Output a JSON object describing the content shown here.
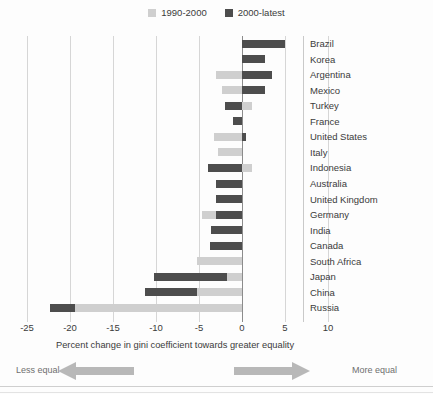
{
  "legend": {
    "entries": [
      {
        "label": "1990-2000",
        "color": "#cfcfcf",
        "icon": "legend-swatch-light"
      },
      {
        "label": "2000-latest",
        "color": "#4d4d4d",
        "icon": "legend-swatch-dark"
      }
    ]
  },
  "axis": {
    "title": "Percent change in gini coefficient towards greater equality",
    "ticks": [
      "-25",
      "-20",
      "-15",
      "-10",
      "-5",
      "0",
      "5",
      "10"
    ]
  },
  "annotation": {
    "left_label": "Less equal",
    "right_label": "More equal",
    "left_arrow_icon": "arrow-left-icon",
    "right_arrow_icon": "arrow-right-icon"
  },
  "chart_data": {
    "type": "bar",
    "orientation": "horizontal",
    "title": "",
    "xlabel": "Percent change in gini coefficient towards greater equality",
    "ylabel": "",
    "xlim": [
      -27,
      12
    ],
    "xticks": [
      -25,
      -20,
      -15,
      -10,
      -5,
      0,
      5,
      10
    ],
    "grid": true,
    "legend_position": "top-center",
    "categories": [
      "Brazil",
      "Korea",
      "Argentina",
      "Mexico",
      "Turkey",
      "France",
      "United States",
      "Italy",
      "Indonesia",
      "Australia",
      "United Kingdom",
      "Germany",
      "India",
      "Canada",
      "South Africa",
      "Japan",
      "China",
      "Russia"
    ],
    "series": [
      {
        "name": "1990-2000",
        "color": "#cfcfcf",
        "values": [
          0.0,
          0.0,
          -3.0,
          -2.3,
          1.2,
          0.0,
          -3.2,
          -2.8,
          1.2,
          0.0,
          0.0,
          -4.7,
          -3.6,
          -3.7,
          -5.2,
          -1.8,
          -5.2,
          -19.4
        ]
      },
      {
        "name": "2000-latest",
        "color": "#4d4d4d",
        "values": [
          5.0,
          2.7,
          3.5,
          2.7,
          -2.0,
          -1.0,
          0.5,
          0.0,
          -4.0,
          -3.0,
          -3.0,
          -3.0,
          -3.6,
          -3.7,
          0.0,
          -10.2,
          -11.3,
          -22.3
        ]
      }
    ],
    "bar_segments": [
      {
        "category": "Brazil",
        "light_from": 0.0,
        "light_to": 0.0,
        "dark_from": 0.0,
        "dark_to": 5.0
      },
      {
        "category": "Korea",
        "light_from": 0.0,
        "light_to": 0.0,
        "dark_from": 0.0,
        "dark_to": 2.7
      },
      {
        "category": "Argentina",
        "light_from": -3.0,
        "light_to": 0.0,
        "dark_from": 0.0,
        "dark_to": 3.5
      },
      {
        "category": "Mexico",
        "light_from": -2.3,
        "light_to": 0.0,
        "dark_from": 0.0,
        "dark_to": 2.7
      },
      {
        "category": "Turkey",
        "light_from": 0.0,
        "light_to": 1.2,
        "dark_from": -2.0,
        "dark_to": 0.0
      },
      {
        "category": "France",
        "light_from": 0.0,
        "light_to": 0.0,
        "dark_from": -1.0,
        "dark_to": 0.0
      },
      {
        "category": "United States",
        "light_from": -3.2,
        "light_to": 0.0,
        "dark_from": 0.0,
        "dark_to": 0.5
      },
      {
        "category": "Italy",
        "light_from": -2.8,
        "light_to": 0.0,
        "dark_from": 0.0,
        "dark_to": 0.0
      },
      {
        "category": "Indonesia",
        "light_from": 0.0,
        "light_to": 1.2,
        "dark_from": -4.0,
        "dark_to": 0.0
      },
      {
        "category": "Australia",
        "light_from": 0.0,
        "light_to": 0.0,
        "dark_from": -3.0,
        "dark_to": 0.0
      },
      {
        "category": "United Kingdom",
        "light_from": 0.0,
        "light_to": 0.0,
        "dark_from": -3.0,
        "dark_to": 0.0
      },
      {
        "category": "Germany",
        "light_from": -4.7,
        "light_to": 0.0,
        "dark_from": -3.0,
        "dark_to": 0.0
      },
      {
        "category": "India",
        "light_from": -3.6,
        "light_to": 0.0,
        "dark_from": -3.6,
        "dark_to": 0.0
      },
      {
        "category": "Canada",
        "light_from": -3.7,
        "light_to": 0.0,
        "dark_from": -3.7,
        "dark_to": 0.0
      },
      {
        "category": "South Africa",
        "light_from": -5.2,
        "light_to": 0.0,
        "dark_from": 0.0,
        "dark_to": 0.0
      },
      {
        "category": "Japan",
        "light_from": -10.2,
        "light_to": 0.0,
        "dark_from": -10.2,
        "dark_to": -1.8
      },
      {
        "category": "China",
        "light_from": -11.3,
        "light_to": 0.0,
        "dark_from": -11.3,
        "dark_to": -5.2
      },
      {
        "category": "Russia",
        "light_from": -22.3,
        "light_to": 0.0,
        "dark_from": -22.3,
        "dark_to": -19.4
      }
    ]
  }
}
